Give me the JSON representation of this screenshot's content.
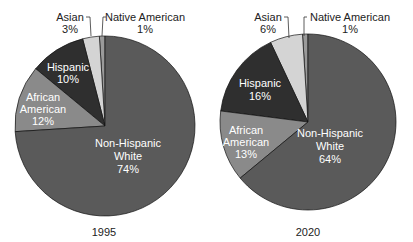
{
  "chart_data": [
    {
      "type": "pie",
      "title": "1995",
      "categories": [
        "Non-Hispanic White",
        "African American",
        "Hispanic",
        "Asian",
        "Native American"
      ],
      "values": [
        74,
        12,
        10,
        3,
        1
      ],
      "unit": "%",
      "colors": [
        "#5a5a5a",
        "#8a8a8a",
        "#2f2f2f",
        "#d4d4d4",
        "#9a9a9a"
      ]
    },
    {
      "type": "pie",
      "title": "2020",
      "categories": [
        "Non-Hispanic White",
        "African American",
        "Hispanic",
        "Asian",
        "Native American"
      ],
      "values": [
        64,
        13,
        16,
        6,
        1
      ],
      "unit": "%",
      "colors": [
        "#5a5a5a",
        "#8a8a8a",
        "#2f2f2f",
        "#d4d4d4",
        "#9a9a9a"
      ]
    }
  ],
  "labels": {
    "p1": {
      "year": "1995",
      "white_1": "Non-Hispanic",
      "white_2": "White",
      "white_pct": "74%",
      "afam_1": "African",
      "afam_2": "American",
      "afam_pct": "12%",
      "hisp_1": "Hispanic",
      "hisp_pct": "10%",
      "asian_1": "Asian",
      "asian_pct": "3%",
      "native_1": "Native American",
      "native_pct": "1%"
    },
    "p2": {
      "year": "2020",
      "white_1": "Non-Hispanic",
      "white_2": "White",
      "white_pct": "64%",
      "afam_1": "African",
      "afam_2": "American",
      "afam_pct": "13%",
      "hisp_1": "Hispanic",
      "hisp_pct": "16%",
      "asian_1": "Asian",
      "asian_pct": "6%",
      "native_1": "Native American",
      "native_pct": "1%"
    }
  }
}
